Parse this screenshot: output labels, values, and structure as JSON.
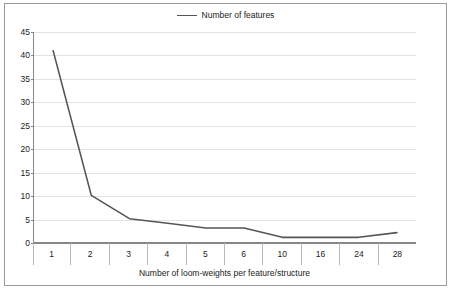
{
  "legend": {
    "entries": [
      {
        "label": "Number of features",
        "color": "#555555",
        "marker": "line"
      }
    ],
    "position": "top-center"
  },
  "axes": {
    "y": {
      "ticks": [
        0,
        5,
        10,
        15,
        20,
        25,
        30,
        35,
        40,
        45
      ],
      "min": 0,
      "max": 45,
      "step": 5,
      "label": ""
    },
    "x": {
      "title": "Number of loom-weights per feature/structure",
      "categories": [
        "1",
        "2",
        "3",
        "4",
        "5",
        "6",
        "10",
        "16",
        "24",
        "28"
      ]
    }
  },
  "style": {
    "line_color": "#555555",
    "grid_color": "#e3e3e3",
    "axis_color": "#868686",
    "frame_color": "#9a9a9a",
    "background": "#ffffff",
    "text_color": "#1a1a1a"
  },
  "chart_data": {
    "type": "line",
    "title": "",
    "subtitle": "",
    "xlabel": "Number of loom-weights per feature/structure",
    "ylabel": "",
    "categories": [
      "1",
      "2",
      "3",
      "4",
      "5",
      "6",
      "10",
      "16",
      "24",
      "28"
    ],
    "series": [
      {
        "name": "Number of features",
        "color": "#555555",
        "values": [
          41,
          10,
          5,
          4,
          3,
          3,
          1,
          1,
          1,
          2
        ]
      }
    ],
    "ylim": [
      0,
      45
    ],
    "ytick_step": 5,
    "grid": "horizontal",
    "legend_position": "top-center",
    "markers": false
  }
}
